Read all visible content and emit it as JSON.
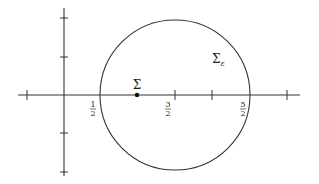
{
  "diagram": {
    "type": "geometric-plot",
    "colors": {
      "stroke": "#333333",
      "background": "#ffffff"
    },
    "axes": {
      "horizontal": {
        "x1": 18,
        "x2": 300,
        "y": 95
      },
      "vertical": {
        "x": 64,
        "y1": 8,
        "y2": 176
      },
      "horizontal_ticks": [
        27,
        212,
        287
      ],
      "vertical_ticks": [
        18,
        57,
        133,
        172
      ]
    },
    "circle": {
      "cx": 175,
      "cy": 95,
      "r": 75,
      "label": "Σ",
      "subscript": "ε"
    },
    "point": {
      "x": 137,
      "y": 95,
      "label": "Σ"
    },
    "tick_labels": [
      {
        "x": 100,
        "num": "1",
        "den": "2",
        "tick": false
      },
      {
        "x": 175,
        "num": "3",
        "den": "2",
        "tick": true
      },
      {
        "x": 250,
        "num": "5",
        "den": "2",
        "tick": false
      }
    ]
  }
}
